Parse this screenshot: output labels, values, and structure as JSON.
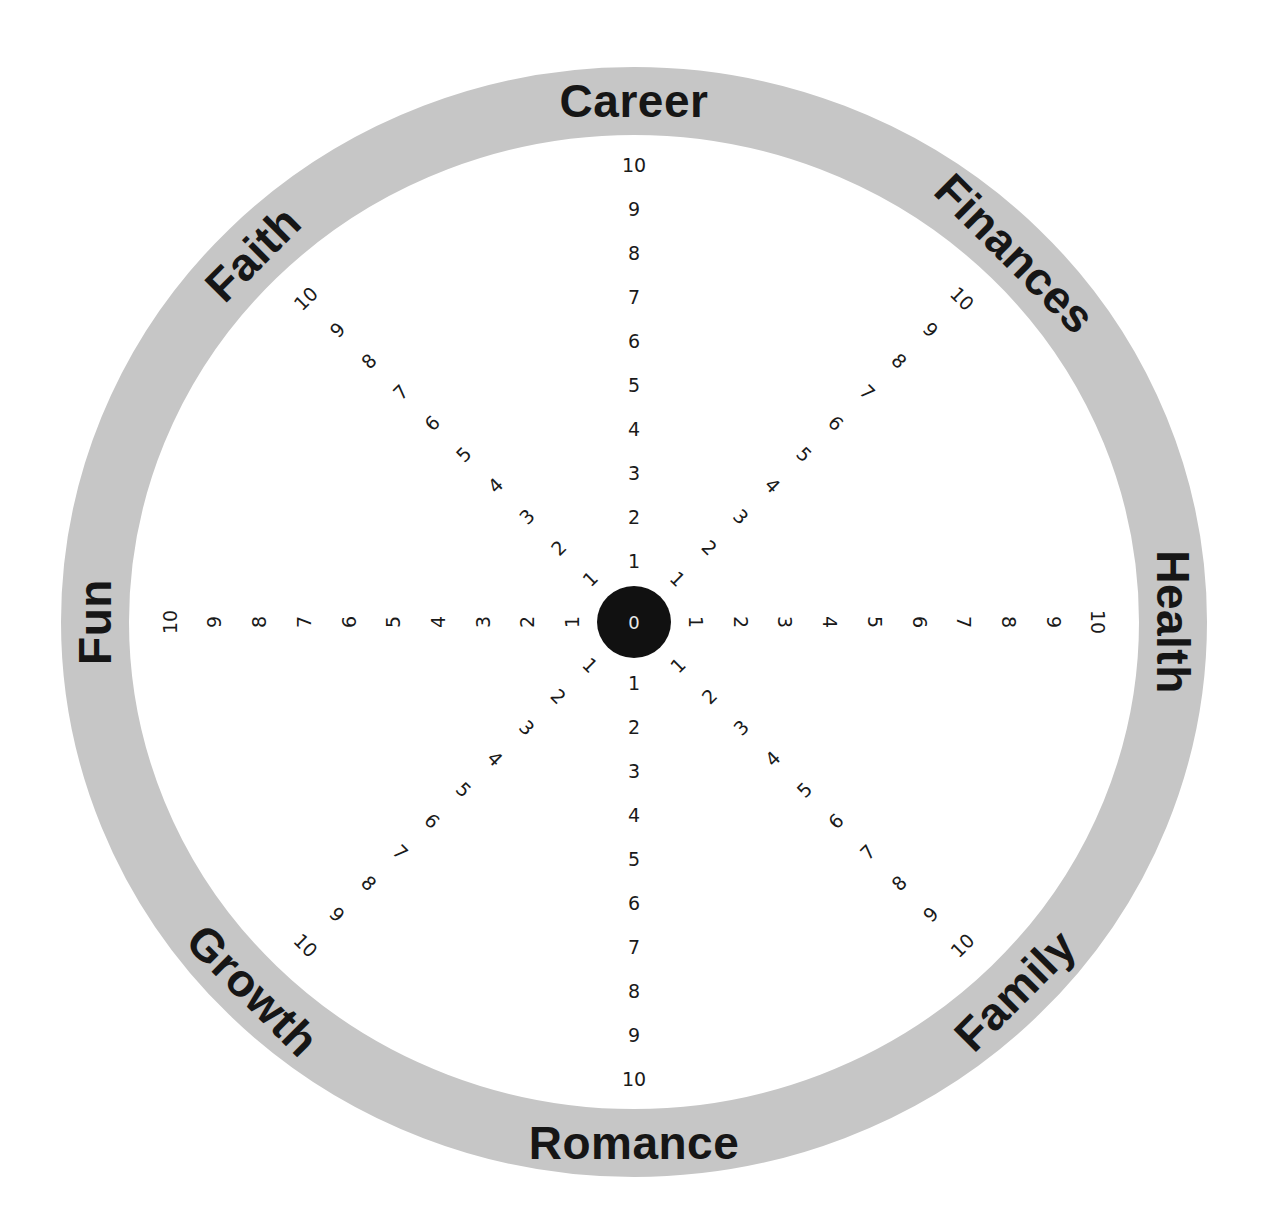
{
  "colors": {
    "ring": "#c6c6c6",
    "background": "#ffffff",
    "hub": "#111111",
    "text": "#161616"
  },
  "hub": {
    "label": "0"
  },
  "scale": {
    "min": 0,
    "max": 10,
    "ticks": [
      "1",
      "2",
      "3",
      "4",
      "5",
      "6",
      "7",
      "8",
      "9",
      "10"
    ]
  },
  "categories": [
    {
      "id": "career",
      "label": "Career",
      "angle": 0
    },
    {
      "id": "finances",
      "label": "Finances",
      "angle": 45
    },
    {
      "id": "health",
      "label": "Health",
      "angle": 90
    },
    {
      "id": "family",
      "label": "Family",
      "angle": 135
    },
    {
      "id": "romance",
      "label": "Romance",
      "angle": 180
    },
    {
      "id": "growth",
      "label": "Growth",
      "angle": 225
    },
    {
      "id": "fun",
      "label": "Fun",
      "angle": 270
    },
    {
      "id": "faith",
      "label": "Faith",
      "angle": 315
    }
  ]
}
